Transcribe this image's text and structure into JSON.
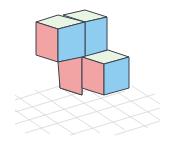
{
  "diagram": {
    "type": "isometric-cube-structure",
    "cube_count": 4,
    "colors": {
      "front_face": "#F2A3A3",
      "side_face": "#8FCDF0",
      "top_face": "#E8F5E2",
      "edge": "#3A4250",
      "grid": "#D4D4D4",
      "background": "#FFFFFF"
    },
    "cubes": [
      {
        "id": "upper-left",
        "level": 2
      },
      {
        "id": "upper-right",
        "level": 2
      },
      {
        "id": "lower-left",
        "level": 1
      },
      {
        "id": "lower-right",
        "level": 1
      }
    ],
    "floor": {
      "type": "grid",
      "rows": 5,
      "cols": 6
    }
  }
}
